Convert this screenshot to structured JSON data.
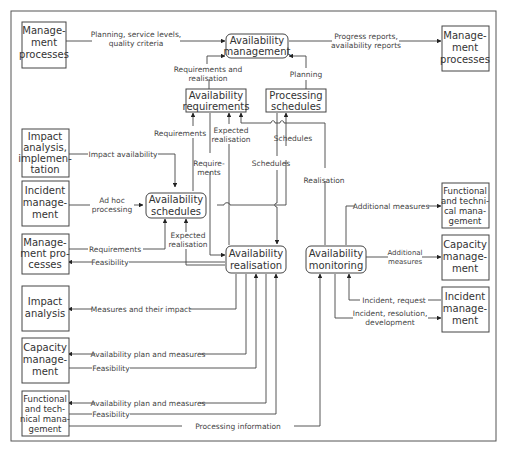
{
  "diagram": {
    "boxes": {
      "mgmt_top_left": [
        "Manage-",
        "ment",
        "processes"
      ],
      "mgmt_top_right": [
        "Manage-",
        "ment",
        "processes"
      ],
      "avail_mgmt": [
        "Availability",
        "management"
      ],
      "avail_req": [
        "Availability",
        "requirements"
      ],
      "proc_sched": [
        "Processing",
        "schedules"
      ],
      "impact_impl": [
        "Impact",
        "analysis,",
        "implemen-",
        "tation"
      ],
      "incident_left": [
        "Incident",
        "manage-",
        "ment"
      ],
      "avail_sched": [
        "Availability",
        "schedules"
      ],
      "mgmt_mid_left": [
        "Manage-",
        "ment pro-",
        "cesses"
      ],
      "avail_real": [
        "Availability",
        "realisation"
      ],
      "avail_mon": [
        "Availability",
        "monitoring"
      ],
      "func_tech_right": [
        "Functional",
        "and techni-",
        "cal mana-",
        "gement"
      ],
      "capacity_right": [
        "Capacity",
        "manage-",
        "ment"
      ],
      "incident_right": [
        "Incident",
        "manage-",
        "ment"
      ],
      "impact_analysis": [
        "Impact",
        "analysis"
      ],
      "capacity_left": [
        "Capacity",
        "manage-",
        "ment"
      ],
      "func_tech_left": [
        "Functional",
        "and tech-",
        "nical mana-",
        "gement"
      ]
    },
    "labels": {
      "planning_service": [
        "Planning, service levels,",
        "quality criteria"
      ],
      "progress_reports": [
        "Progress reports,",
        "availability reports"
      ],
      "req_and_real": [
        "Requirements and",
        "realisation"
      ],
      "planning": "Planning",
      "requirements_up": "Requirements",
      "expected_real_top": [
        "Expected",
        "realisation"
      ],
      "require_ments": [
        "Require-",
        "ments"
      ],
      "schedules_a": "Schedules",
      "schedules_b": "Schedules",
      "realisation": "Realisation",
      "impact_availability": "Impact availability",
      "ad_hoc": [
        "Ad hoc",
        "processing"
      ],
      "requirements_mid": "Requirements",
      "expected_real_mid": [
        "Expected",
        "realisation"
      ],
      "feasibility_1": "Feasibility",
      "additional_measures_1": "Additional measures",
      "additional_measures_2": [
        "Additional",
        "measures"
      ],
      "incident_request": "Incident, request",
      "incident_resolution": [
        "Incident, resolution,",
        "development"
      ],
      "measures_impact": "Measures and their impact",
      "avail_plan_1": "Availability plan and measures",
      "feasibility_2": "Feasibility",
      "avail_plan_2": "Availability plan and measures",
      "feasibility_3": "Feasibility",
      "processing_info": "Processing information"
    }
  }
}
